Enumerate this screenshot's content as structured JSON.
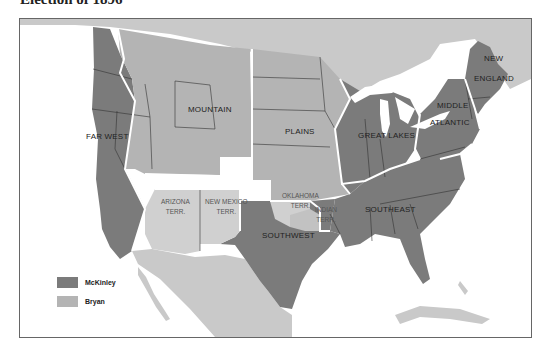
{
  "title": "Election of 1896",
  "colors": {
    "mckinley": "#7b7b7b",
    "bryan": "#b4b4b4",
    "foreign_land": "#c9c9c9",
    "water": "#ffffff",
    "section_border": "#ffffff",
    "state_border": "#333333"
  },
  "legend": {
    "items": [
      {
        "label": "McKinley",
        "color": "#7b7b7b"
      },
      {
        "label": "Bryan",
        "color": "#b4b4b4"
      }
    ]
  },
  "regions": {
    "far_west": "FAR WEST",
    "mountain": "MOUNTAIN",
    "plains": "PLAINS",
    "great_lakes": "GREAT LAKES",
    "new_england_1": "NEW",
    "new_england_2": "ENGLAND",
    "middle_atlantic_1": "MIDDLE",
    "middle_atlantic_2": "ATLANTIC",
    "southeast": "SOUTHEAST",
    "southwest": "SOUTHWEST"
  },
  "territories": {
    "arizona_1": "ARIZONA",
    "arizona_2": "TERR.",
    "new_mexico_1": "NEW MEXICO",
    "new_mexico_2": "TERR.",
    "oklahoma_1": "OKLAHOMA",
    "oklahoma_2": "TERR.",
    "indian_1": "INDIAN",
    "indian_2": "TERR."
  }
}
